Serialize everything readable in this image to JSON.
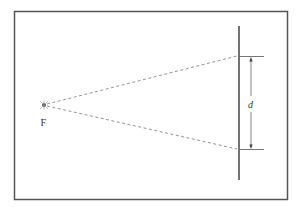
{
  "diagram": {
    "point_label": "F",
    "distance_label": "d",
    "colors": {
      "frame": "#555555",
      "screen": "#444444",
      "rays": "#888888",
      "dimension": "#555555"
    }
  }
}
